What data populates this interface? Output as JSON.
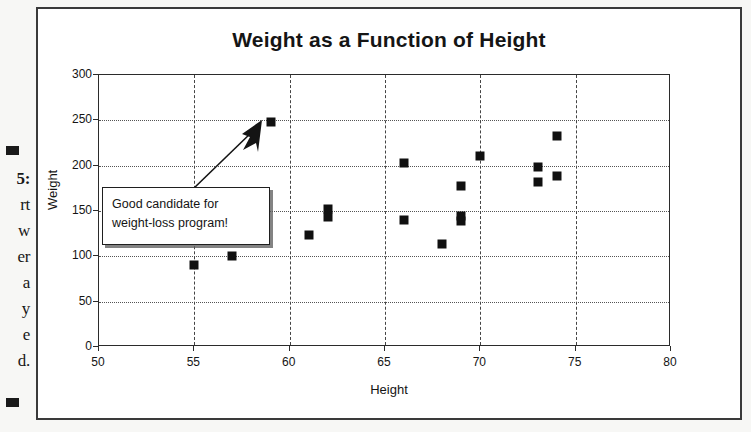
{
  "page_margin": {
    "fragments": [
      {
        "text": "5:",
        "bold": true,
        "top": 170
      },
      {
        "text": "rt",
        "bold": false,
        "top": 196
      },
      {
        "text": "w",
        "bold": false,
        "top": 222
      },
      {
        "text": "er",
        "bold": false,
        "top": 248
      },
      {
        "text": "a",
        "bold": false,
        "top": 274
      },
      {
        "text": "y",
        "bold": false,
        "top": 300
      },
      {
        "text": "e",
        "bold": false,
        "top": 326
      },
      {
        "text": "d.",
        "bold": false,
        "top": 352
      }
    ],
    "bullets": [
      {
        "top": 146
      },
      {
        "top": 398
      }
    ]
  },
  "chart_data": {
    "type": "scatter",
    "title": "Weight as a Function of Height",
    "xlabel": "Height",
    "ylabel": "Weight",
    "xlim": [
      50,
      80
    ],
    "ylim": [
      0,
      300
    ],
    "xticks": [
      50,
      55,
      60,
      65,
      70,
      75,
      80
    ],
    "yticks": [
      0,
      50,
      100,
      150,
      200,
      250,
      300
    ],
    "grid": "both",
    "legend": "none",
    "marker": "filled-square",
    "marker_color": "#101010",
    "points": [
      {
        "x": 55,
        "y": 90
      },
      {
        "x": 57,
        "y": 100
      },
      {
        "x": 59,
        "y": 248
      },
      {
        "x": 61,
        "y": 123
      },
      {
        "x": 62,
        "y": 152
      },
      {
        "x": 62,
        "y": 143
      },
      {
        "x": 66,
        "y": 203
      },
      {
        "x": 66,
        "y": 140
      },
      {
        "x": 68,
        "y": 114
      },
      {
        "x": 69,
        "y": 178
      },
      {
        "x": 69,
        "y": 145
      },
      {
        "x": 69,
        "y": 139
      },
      {
        "x": 70,
        "y": 211
      },
      {
        "x": 73,
        "y": 198
      },
      {
        "x": 73,
        "y": 182
      },
      {
        "x": 74,
        "y": 233
      },
      {
        "x": 74,
        "y": 189
      }
    ],
    "annotations": [
      {
        "kind": "callout",
        "line1": "Good candidate for",
        "line2": "weight-loss program!",
        "points_to": {
          "x": 59,
          "y": 248
        }
      }
    ]
  }
}
